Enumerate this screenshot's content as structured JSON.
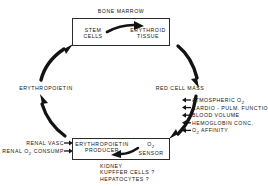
{
  "diagram": {
    "bone_marrow": {
      "caption": "BONE  MARROW",
      "stem_cells": "STEM\nCELLS",
      "stem_cells_line1": "STEM",
      "stem_cells_line2": "CELLS",
      "erythroid_line1": "ERYTHROID",
      "erythroid_line2": "TISSUE",
      "internal_arrow": "stem-cells-to-erythroid-tissue-arrow"
    },
    "cycle_nodes": {
      "erythropoietin": "ERYTHROPOIETIN",
      "red_cell_mass": "RED CELL MASS"
    },
    "organ_box": {
      "producer_line1": "ERYTHROPOIETIN",
      "producer_line2": "PRODUCER",
      "sensor_line1": "O",
      "sensor_sub": "2",
      "sensor_line2": "SENSOR",
      "internal_arrow": "sensor-to-producer-arrow"
    },
    "organ_caption": {
      "line1": "KIDNEY",
      "line2": "KUPFFER CELLS ?",
      "line3": "HEPATOCYTES ?"
    },
    "renal_inputs": [
      {
        "label": "RENAL  VASC",
        "arrow": "right-arrow"
      },
      {
        "label": "RENAL  O",
        "sub": "2",
        "label_tail": "  CONSUMP",
        "arrow": "right-arrow"
      }
    ],
    "oxygen_factors": [
      {
        "label": "ATMOSPHERIC  O",
        "sub": "2",
        "tail": ""
      },
      {
        "label": "CARDIO - PULM.  FUNCTION",
        "sub": "",
        "tail": ""
      },
      {
        "label": "BLOOD  VOLUME",
        "sub": "",
        "tail": ""
      },
      {
        "label": "HEMOGLOBIN  CONC.",
        "sub": "",
        "tail": ""
      },
      {
        "label": "O",
        "sub": "2",
        "tail": "  AFFINITY"
      }
    ],
    "flow_arrows": [
      {
        "name": "epo-to-bone-marrow-arrow",
        "direction": "up-right"
      },
      {
        "name": "bone-marrow-to-red-cell-mass-arrow",
        "direction": "down-right"
      },
      {
        "name": "red-cell-mass-to-o2-sensor-arrow",
        "direction": "down-left"
      },
      {
        "name": "epo-producer-to-epo-arrow",
        "direction": "up-left"
      }
    ],
    "colors": {
      "ink": "#141414",
      "stroke": "#2b2b2b",
      "background": "#ffffff"
    }
  }
}
